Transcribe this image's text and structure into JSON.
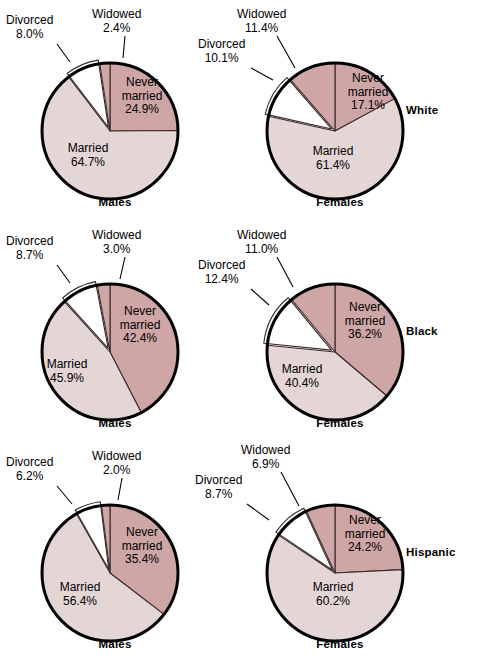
{
  "figure": {
    "title": "",
    "width": 488,
    "height": 667,
    "background": "#ffffff"
  },
  "colors": {
    "never_married": "#cfa6a6",
    "married": "#e5d6d6",
    "divorced": "#ffffff",
    "widowed": "#cfa6a6",
    "outline": "#000000",
    "slice_line": "#3a2a2a",
    "text": "#000000"
  },
  "legend_categories": [
    "Never married",
    "Married",
    "Divorced",
    "Widowed"
  ],
  "group_labels": [
    "White",
    "Black",
    "Hispanic"
  ],
  "sex_labels": [
    "Males",
    "Females"
  ],
  "chart_data": [
    {
      "type": "pie",
      "title": "White Males",
      "group": "White",
      "sex": "Males",
      "categories": [
        "Never married",
        "Married",
        "Divorced",
        "Widowed"
      ],
      "values": [
        24.9,
        64.7,
        8.0,
        2.4
      ],
      "labels": [
        "24.9%",
        "64.7%",
        "8.0%",
        "2.4%"
      ],
      "colors": [
        "#cfa6a6",
        "#e5d6d6",
        "#ffffff",
        "#cfa6a6"
      ],
      "start_angle": 0,
      "direction": "clockwise"
    },
    {
      "type": "pie",
      "title": "White Females",
      "group": "White",
      "sex": "Females",
      "categories": [
        "Never married",
        "Married",
        "Divorced",
        "Widowed"
      ],
      "values": [
        17.1,
        61.4,
        10.1,
        11.4
      ],
      "labels": [
        "17.1%",
        "61.4%",
        "10.1%",
        "11.4%"
      ],
      "colors": [
        "#cfa6a6",
        "#e5d6d6",
        "#ffffff",
        "#cfa6a6"
      ],
      "start_angle": 0,
      "direction": "clockwise"
    },
    {
      "type": "pie",
      "title": "Black Males",
      "group": "Black",
      "sex": "Males",
      "categories": [
        "Never married",
        "Married",
        "Divorced",
        "Widowed"
      ],
      "values": [
        42.4,
        45.9,
        8.7,
        3.0
      ],
      "labels": [
        "42.4%",
        "45.9%",
        "8.7%",
        "3.0%"
      ],
      "colors": [
        "#cfa6a6",
        "#e5d6d6",
        "#ffffff",
        "#cfa6a6"
      ],
      "start_angle": 0,
      "direction": "clockwise"
    },
    {
      "type": "pie",
      "title": "Black Females",
      "group": "Black",
      "sex": "Females",
      "categories": [
        "Never married",
        "Married",
        "Divorced",
        "Widowed"
      ],
      "values": [
        36.2,
        40.4,
        12.4,
        11.0
      ],
      "labels": [
        "36.2%",
        "40.4%",
        "12.4%",
        "11.0%"
      ],
      "colors": [
        "#cfa6a6",
        "#e5d6d6",
        "#ffffff",
        "#cfa6a6"
      ],
      "start_angle": 0,
      "direction": "clockwise"
    },
    {
      "type": "pie",
      "title": "Hispanic Males",
      "group": "Hispanic",
      "sex": "Males",
      "categories": [
        "Never married",
        "Married",
        "Divorced",
        "Widowed"
      ],
      "values": [
        35.4,
        56.4,
        6.2,
        2.0
      ],
      "labels": [
        "35.4%",
        "56.4%",
        "6.2%",
        "2.0%"
      ],
      "colors": [
        "#cfa6a6",
        "#e5d6d6",
        "#ffffff",
        "#cfa6a6"
      ],
      "start_angle": 0,
      "direction": "clockwise"
    },
    {
      "type": "pie",
      "title": "Hispanic Females",
      "group": "Hispanic",
      "sex": "Females",
      "categories": [
        "Never married",
        "Married",
        "Divorced",
        "Widowed"
      ],
      "values": [
        24.2,
        60.2,
        8.7,
        6.9
      ],
      "labels": [
        "24.2%",
        "60.2%",
        "8.7%",
        "6.9%"
      ],
      "colors": [
        "#cfa6a6",
        "#e5d6d6",
        "#ffffff",
        "#cfa6a6"
      ],
      "start_angle": 0,
      "direction": "clockwise"
    }
  ],
  "charts": [
    {
      "id": "white-males",
      "sex_label": "Males",
      "never_married": {
        "name": "Never",
        "name2": "married",
        "value": "24.9%"
      },
      "married": {
        "name": "Married",
        "value": "64.7%"
      },
      "divorced": {
        "name": "Divorced",
        "value": "8.0%"
      },
      "widowed": {
        "name": "Widowed",
        "value": "2.4%"
      }
    },
    {
      "id": "white-females",
      "sex_label": "Females",
      "never_married": {
        "name": "Never",
        "name2": "married",
        "value": "17.1%"
      },
      "married": {
        "name": "Married",
        "value": "61.4%"
      },
      "divorced": {
        "name": "Divorced",
        "value": "10.1%"
      },
      "widowed": {
        "name": "Widowed",
        "value": "11.4%"
      }
    },
    {
      "id": "black-males",
      "sex_label": "Males",
      "never_married": {
        "name": "Never",
        "name2": "married",
        "value": "42.4%"
      },
      "married": {
        "name": "Married",
        "value": "45.9%"
      },
      "divorced": {
        "name": "Divorced",
        "value": "8.7%"
      },
      "widowed": {
        "name": "Widowed",
        "value": "3.0%"
      }
    },
    {
      "id": "black-females",
      "sex_label": "Females",
      "never_married": {
        "name": "Never",
        "name2": "married",
        "value": "36.2%"
      },
      "married": {
        "name": "Married",
        "value": "40.4%"
      },
      "divorced": {
        "name": "Divorced",
        "value": "12.4%"
      },
      "widowed": {
        "name": "Widowed",
        "value": "11.0%"
      }
    },
    {
      "id": "hispanic-males",
      "sex_label": "Males",
      "never_married": {
        "name": "Never",
        "name2": "married",
        "value": "35.4%"
      },
      "married": {
        "name": "Married",
        "value": "56.4%"
      },
      "divorced": {
        "name": "Divorced",
        "value": "6.2%"
      },
      "widowed": {
        "name": "Widowed",
        "value": "2.0%"
      }
    },
    {
      "id": "hispanic-females",
      "sex_label": "Females",
      "never_married": {
        "name": "Never",
        "name2": "married",
        "value": "24.2%"
      },
      "married": {
        "name": "Married",
        "value": "60.2%"
      },
      "divorced": {
        "name": "Divorced",
        "value": "8.7%"
      },
      "widowed": {
        "name": "Widowed",
        "value": "6.9%"
      }
    }
  ]
}
